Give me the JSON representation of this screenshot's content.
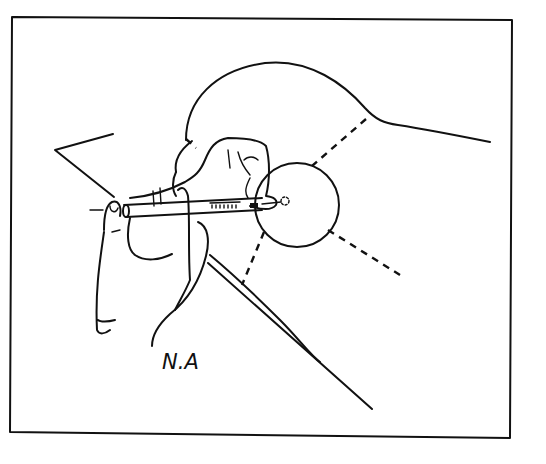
{
  "figure": {
    "signature": "N.A",
    "colors": {
      "ink": "#111111",
      "paper": "#ffffff"
    }
  }
}
